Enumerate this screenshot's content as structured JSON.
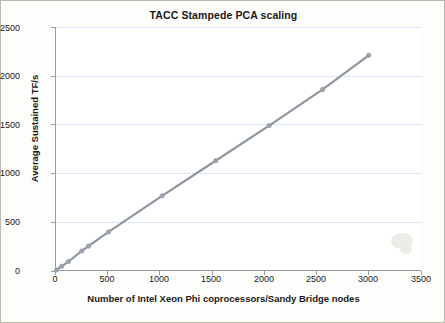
{
  "chart_data": {
    "type": "line",
    "title": "TACC Stampede PCA scaling",
    "xlabel": "Number of Intel Xeon Phi coprocessors/Sandy Bridge nodes",
    "ylabel": "Average Sustained TF/s",
    "xlim": [
      0,
      3500
    ],
    "ylim": [
      0,
      2500
    ],
    "xticks": [
      0,
      500,
      1000,
      1500,
      2000,
      2500,
      3000,
      3500
    ],
    "yticks": [
      0,
      500,
      1000,
      1500,
      2000,
      2500
    ],
    "grid": "horizontal",
    "legend": "none",
    "marker_color": "#9aa3ad",
    "line_color": "#8e969f",
    "series": [
      {
        "name": "Average Sustained TF/s",
        "x": [
          16,
          64,
          128,
          256,
          320,
          512,
          1024,
          1536,
          2048,
          2560,
          3000
        ],
        "y": [
          12,
          48,
          96,
          205,
          255,
          400,
          770,
          1130,
          1490,
          1860,
          2210
        ]
      }
    ]
  },
  "axis": {
    "ytick_labels": [
      "2500",
      "2000",
      "1500",
      "1000",
      "500",
      "0"
    ],
    "xtick_labels": [
      "0",
      "500",
      "1000",
      "1500",
      "2000",
      "2500",
      "3000",
      "3500"
    ]
  }
}
